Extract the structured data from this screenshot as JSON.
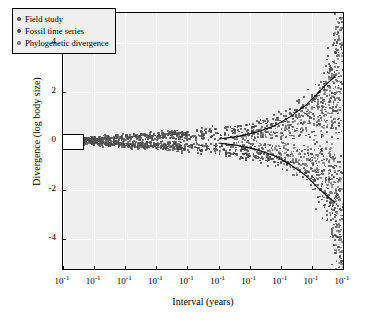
{
  "chart_data": {
    "type": "scatter",
    "title": "",
    "xlabel": "Interval (years)",
    "ylabel": "Divergence (log body size)",
    "xlim": [
      0,
      9
    ],
    "ylim": [
      -5.2,
      5.2
    ],
    "x_tick_labels": [
      "10⁰",
      "10¹",
      "10²",
      "10³",
      "10⁴",
      "10⁵",
      "10⁶",
      "10⁷",
      "10⁸",
      "10⁹"
    ],
    "x_tick_values": [
      0,
      1,
      2,
      3,
      4,
      5,
      6,
      7,
      8,
      9
    ],
    "y_tick_labels": [
      "4",
      "2",
      "0",
      "-2",
      "-4"
    ],
    "y_tick_values": [
      4,
      2,
      0,
      -2,
      -4
    ],
    "grid": true,
    "legend_position": "top-left",
    "legend": [
      {
        "label": "Field study",
        "color": "#555555"
      },
      {
        "label": "Fossil time series",
        "color": "#4a4a4a"
      },
      {
        "label": "Phylogenetic divergence",
        "color": "#777777"
      }
    ],
    "series": [
      {
        "name": "Field study",
        "color": "#4f4f4f",
        "marker": "circle",
        "points": [
          [
            0.05,
            0.02
          ],
          [
            0.08,
            -0.03
          ],
          [
            0.12,
            0.05
          ],
          [
            0.15,
            -0.07
          ],
          [
            0.2,
            0.04
          ],
          [
            0.24,
            -0.02
          ],
          [
            0.3,
            0.08
          ],
          [
            0.34,
            -0.09
          ],
          [
            0.4,
            0.03
          ],
          [
            0.45,
            -0.05
          ],
          [
            0.5,
            0.1
          ],
          [
            0.55,
            -0.11
          ],
          [
            0.6,
            0.06
          ],
          [
            0.66,
            -0.04
          ],
          [
            0.72,
            0.12
          ],
          [
            0.78,
            -0.13
          ],
          [
            0.85,
            0.07
          ],
          [
            0.9,
            -0.06
          ],
          [
            0.95,
            0.14
          ],
          [
            1.0,
            -0.15
          ],
          [
            1.05,
            0.09
          ],
          [
            1.1,
            -0.08
          ],
          [
            1.18,
            0.16
          ],
          [
            1.25,
            -0.17
          ],
          [
            1.3,
            0.11
          ],
          [
            1.38,
            -0.1
          ],
          [
            1.45,
            0.18
          ],
          [
            1.5,
            -0.19
          ],
          [
            1.58,
            0.13
          ],
          [
            1.65,
            -0.12
          ],
          [
            1.72,
            0.2
          ],
          [
            1.8,
            -0.21
          ],
          [
            1.88,
            0.15
          ],
          [
            1.95,
            -0.14
          ],
          [
            2.02,
            0.22
          ],
          [
            2.1,
            -0.23
          ],
          [
            2.18,
            0.17
          ],
          [
            2.25,
            -0.16
          ],
          [
            2.32,
            0.24
          ],
          [
            2.4,
            -0.25
          ],
          [
            2.48,
            0.19
          ],
          [
            2.55,
            -0.18
          ],
          [
            2.62,
            0.26
          ],
          [
            2.7,
            -0.27
          ],
          [
            2.78,
            0.21
          ],
          [
            2.85,
            -0.2
          ],
          [
            2.92,
            0.28
          ],
          [
            3.0,
            -0.29
          ],
          [
            3.08,
            0.23
          ],
          [
            3.15,
            -0.22
          ],
          [
            3.22,
            0.3
          ],
          [
            3.3,
            -0.31
          ],
          [
            3.38,
            0.25
          ],
          [
            3.45,
            -0.24
          ],
          [
            3.52,
            0.32
          ],
          [
            3.6,
            -0.33
          ],
          [
            3.68,
            0.27
          ],
          [
            3.75,
            -0.26
          ],
          [
            3.82,
            0.34
          ],
          [
            3.9,
            -0.35
          ]
        ]
      },
      {
        "name": "Fossil time series",
        "color": "#454545",
        "marker": "circle",
        "points": [
          [
            3.6,
            0.3
          ],
          [
            3.8,
            -0.32
          ],
          [
            4.0,
            0.36
          ],
          [
            4.15,
            -0.28
          ],
          [
            4.3,
            0.42
          ],
          [
            4.45,
            -0.38
          ],
          [
            4.6,
            0.34
          ],
          [
            4.75,
            -0.44
          ],
          [
            4.9,
            0.48
          ],
          [
            5.05,
            -0.4
          ],
          [
            5.2,
            0.52
          ],
          [
            5.35,
            -0.5
          ],
          [
            5.5,
            0.46
          ],
          [
            5.6,
            -0.56
          ],
          [
            5.7,
            0.6
          ],
          [
            5.8,
            -0.52
          ],
          [
            5.9,
            0.66
          ],
          [
            6.0,
            -0.62
          ],
          [
            6.1,
            0.58
          ],
          [
            6.2,
            -0.7
          ],
          [
            6.3,
            0.74
          ],
          [
            6.4,
            -0.66
          ],
          [
            6.5,
            0.82
          ],
          [
            6.6,
            -0.78
          ],
          [
            6.7,
            0.7
          ],
          [
            6.8,
            -0.86
          ],
          [
            6.9,
            0.94
          ],
          [
            7.0,
            -0.88
          ],
          [
            7.1,
            1.02
          ],
          [
            7.2,
            -0.96
          ],
          [
            7.3,
            1.12
          ],
          [
            7.4,
            -1.06
          ],
          [
            7.5,
            1.24
          ],
          [
            7.6,
            -1.18
          ],
          [
            7.7,
            1.36
          ],
          [
            7.8,
            -1.3
          ],
          [
            7.9,
            1.5
          ],
          [
            8.0,
            -1.44
          ],
          [
            8.05,
            1.68
          ],
          [
            8.1,
            -1.6
          ],
          [
            8.15,
            1.84
          ],
          [
            8.2,
            -1.78
          ],
          [
            8.25,
            2.0
          ],
          [
            8.3,
            -1.94
          ],
          [
            8.35,
            2.2
          ],
          [
            8.4,
            -2.1
          ],
          [
            8.45,
            2.4
          ],
          [
            8.5,
            -2.3
          ],
          [
            8.55,
            2.6
          ],
          [
            8.6,
            -2.5
          ],
          [
            8.65,
            2.9
          ],
          [
            8.7,
            -2.8
          ],
          [
            8.72,
            3.2
          ],
          [
            8.74,
            -3.1
          ],
          [
            8.76,
            3.6
          ],
          [
            8.78,
            -3.5
          ],
          [
            8.8,
            4.0
          ],
          [
            8.82,
            -3.9
          ],
          [
            8.84,
            4.4
          ],
          [
            8.86,
            -4.3
          ],
          [
            8.88,
            4.8
          ],
          [
            8.9,
            -4.7
          ],
          [
            8.92,
            5.0
          ],
          [
            8.94,
            -4.9
          ]
        ]
      },
      {
        "name": "Phylogenetic divergence",
        "color": "#7a7a7a",
        "marker": "circle",
        "points": [
          [
            5.6,
            0.2
          ],
          [
            5.9,
            -0.25
          ],
          [
            6.2,
            0.4
          ],
          [
            6.5,
            -0.45
          ],
          [
            6.8,
            0.6
          ],
          [
            7.0,
            -0.55
          ],
          [
            7.2,
            0.8
          ],
          [
            7.4,
            -0.75
          ],
          [
            7.6,
            1.0
          ],
          [
            7.8,
            -0.95
          ],
          [
            8.0,
            1.3
          ],
          [
            8.1,
            -1.2
          ],
          [
            8.2,
            1.6
          ],
          [
            8.3,
            -1.5
          ],
          [
            8.4,
            1.9
          ],
          [
            8.5,
            -1.8
          ],
          [
            8.55,
            2.2
          ],
          [
            8.6,
            -2.1
          ],
          [
            8.65,
            2.6
          ],
          [
            8.7,
            -2.5
          ],
          [
            8.75,
            3.0
          ],
          [
            8.8,
            -2.9
          ],
          [
            8.85,
            3.5
          ],
          [
            8.88,
            -3.4
          ],
          [
            8.9,
            4.1
          ],
          [
            8.92,
            -4.0
          ],
          [
            8.94,
            4.6
          ],
          [
            8.95,
            -4.5
          ],
          [
            8.96,
            5.0
          ],
          [
            8.97,
            -5.0
          ]
        ]
      }
    ],
    "envelope_upper": {
      "description": "upper bounding curve rising from ~0 at 10^5 to ~2.6 at 10^8.5",
      "x": [
        5.0,
        5.6,
        6.2,
        6.8,
        7.3,
        7.8,
        8.2,
        8.5,
        8.75
      ],
      "y": [
        0.08,
        0.18,
        0.35,
        0.62,
        0.98,
        1.45,
        1.95,
        2.35,
        2.62
      ]
    },
    "envelope_lower": {
      "description": "lower bounding curve falling from ~0 at 10^5 to ~-2.5 at 10^8.5",
      "x": [
        5.0,
        5.6,
        6.2,
        6.8,
        7.3,
        7.8,
        8.2,
        8.5,
        8.75
      ],
      "y": [
        -0.08,
        -0.18,
        -0.34,
        -0.6,
        -0.95,
        -1.4,
        -1.9,
        -2.25,
        -2.5
      ]
    },
    "box_marker": {
      "x_center": 0.22,
      "y_center": 0.0,
      "width_log_units": 0.75,
      "height_units": 0.55
    }
  }
}
